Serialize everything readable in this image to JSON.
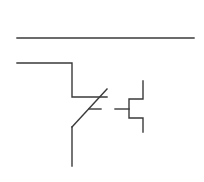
{
  "diagram": {
    "type": "electrical-schematic",
    "symbol": "normally-closed-contact-with-mechanical-actuator",
    "stroke_color": "#3a3a3a",
    "background": "#ffffff",
    "elements": {
      "bus_line": {
        "x1": 17,
        "y1": 38,
        "x2": 194,
        "y2": 38
      },
      "input_wire": {
        "points": "17,63 72,63 72,97 107,97"
      },
      "contact_blade": {
        "x1": 72,
        "y1": 127,
        "x2": 107,
        "y2": 89
      },
      "blade_tick": {
        "x1": 89,
        "y1": 109,
        "x2": 101,
        "y2": 109
      },
      "actuator_link": {
        "x1": 115,
        "y1": 109,
        "x2": 129,
        "y2": 109
      },
      "actuator_body": {
        "points": "143,81 143,99 129,99 129,118 143,118 143,132"
      },
      "output_wire": {
        "x1": 72,
        "y1": 127,
        "x2": 72,
        "y2": 166
      }
    }
  }
}
